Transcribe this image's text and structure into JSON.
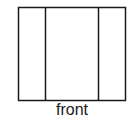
{
  "diagram": {
    "view_label": "front",
    "stroke_color": "#1a1a1a",
    "background": "#ffffff",
    "panels": [
      {
        "name": "left-panel"
      },
      {
        "name": "center-panel"
      },
      {
        "name": "right-panel"
      }
    ]
  }
}
